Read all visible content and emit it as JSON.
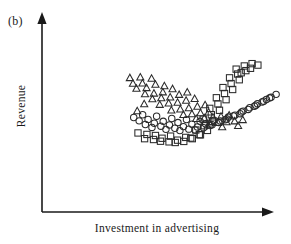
{
  "figure": {
    "panel_label": "(b)",
    "x_axis_label": "Investment in advertising",
    "y_axis_label": "Revenue"
  },
  "chart_data": {
    "type": "scatter",
    "title": "",
    "subtitle": "",
    "xlabel": "Investment in advertising",
    "ylabel": "Revenue",
    "panel": "(b)",
    "grid": false,
    "legend": "none",
    "axis_style": "arrow-tipped L-shaped axes, no tick marks, no tick labels",
    "xlim": [
      0,
      100
    ],
    "ylim": [
      0,
      100
    ],
    "marker_styles": {
      "triangle": "open upward triangle",
      "circle": "open circle",
      "square": "open square"
    },
    "series": [
      {
        "name": "triangle-group",
        "marker": "triangle",
        "count": 46,
        "trend": "decreasing",
        "points": [
          [
            22.6,
            79.8
          ],
          [
            28.0,
            80.4
          ],
          [
            24.2,
            74.5
          ],
          [
            29.1,
            74.8
          ],
          [
            33.8,
            79.2
          ],
          [
            26.0,
            69.8
          ],
          [
            31.2,
            70.4
          ],
          [
            35.8,
            73.6
          ],
          [
            40.4,
            72.2
          ],
          [
            30.4,
            64.6
          ],
          [
            35.0,
            65.2
          ],
          [
            39.6,
            66.4
          ],
          [
            44.6,
            69.4
          ],
          [
            34.2,
            59.8
          ],
          [
            38.8,
            60.8
          ],
          [
            43.4,
            61.6
          ],
          [
            48.0,
            64.0
          ],
          [
            52.2,
            66.2
          ],
          [
            30.0,
            55.2
          ],
          [
            38.0,
            54.6
          ],
          [
            42.6,
            55.8
          ],
          [
            47.2,
            56.6
          ],
          [
            51.6,
            58.4
          ],
          [
            56.0,
            60.1
          ],
          [
            26.4,
            48.6
          ],
          [
            44.0,
            49.2
          ],
          [
            48.6,
            50.2
          ],
          [
            53.0,
            51.4
          ],
          [
            57.4,
            52.8
          ],
          [
            61.4,
            54.2
          ],
          [
            50.2,
            45.0
          ],
          [
            54.6,
            45.8
          ],
          [
            59.0,
            46.6
          ],
          [
            63.2,
            47.4
          ],
          [
            56.8,
            41.2
          ],
          [
            61.0,
            41.8
          ],
          [
            65.4,
            42.6
          ],
          [
            69.6,
            43.4
          ],
          [
            73.8,
            44.6
          ],
          [
            63.6,
            37.0
          ],
          [
            68.0,
            37.6
          ],
          [
            72.4,
            38.2
          ],
          [
            76.6,
            39.0
          ],
          [
            80.8,
            40.2
          ],
          [
            70.2,
            33.4
          ],
          [
            78.4,
            34.6
          ]
        ]
      },
      {
        "name": "circle-group",
        "marker": "circle",
        "count": 49,
        "trend": "increasing",
        "points": [
          [
            24.6,
            42.0
          ],
          [
            29.2,
            44.6
          ],
          [
            27.4,
            38.8
          ],
          [
            32.0,
            40.2
          ],
          [
            36.4,
            43.2
          ],
          [
            30.6,
            35.4
          ],
          [
            35.2,
            36.6
          ],
          [
            39.8,
            38.4
          ],
          [
            44.2,
            41.0
          ],
          [
            34.0,
            32.6
          ],
          [
            38.6,
            33.8
          ],
          [
            43.0,
            35.0
          ],
          [
            47.4,
            37.2
          ],
          [
            51.8,
            40.0
          ],
          [
            41.2,
            30.8
          ],
          [
            45.8,
            31.8
          ],
          [
            50.2,
            33.4
          ],
          [
            54.6,
            35.6
          ],
          [
            58.8,
            38.4
          ],
          [
            48.4,
            29.6
          ],
          [
            53.0,
            31.0
          ],
          [
            57.4,
            33.0
          ],
          [
            61.6,
            36.0
          ],
          [
            66.0,
            39.4
          ],
          [
            56.2,
            30.2
          ],
          [
            60.6,
            32.4
          ],
          [
            65.0,
            35.2
          ],
          [
            69.2,
            38.6
          ],
          [
            73.4,
            42.4
          ],
          [
            64.0,
            34.4
          ],
          [
            68.4,
            37.2
          ],
          [
            72.6,
            40.6
          ],
          [
            76.8,
            44.2
          ],
          [
            81.0,
            48.0
          ],
          [
            71.8,
            39.8
          ],
          [
            76.0,
            43.4
          ],
          [
            80.2,
            47.2
          ],
          [
            84.4,
            51.2
          ],
          [
            88.4,
            55.0
          ],
          [
            79.4,
            45.6
          ],
          [
            83.6,
            49.6
          ],
          [
            87.6,
            53.6
          ],
          [
            91.6,
            57.4
          ],
          [
            95.4,
            61.0
          ],
          [
            86.8,
            52.6
          ],
          [
            90.8,
            56.6
          ],
          [
            94.6,
            60.4
          ],
          [
            98.0,
            63.8
          ],
          [
            93.0,
            59.0
          ]
        ]
      },
      {
        "name": "square-group",
        "marker": "square",
        "count": 42,
        "trend": "increasing",
        "points": [
          [
            26.8,
            27.4
          ],
          [
            31.4,
            26.0
          ],
          [
            35.8,
            25.0
          ],
          [
            30.2,
            22.0
          ],
          [
            34.8,
            21.2
          ],
          [
            39.2,
            22.4
          ],
          [
            43.6,
            24.4
          ],
          [
            38.4,
            19.6
          ],
          [
            42.8,
            19.0
          ],
          [
            47.2,
            20.6
          ],
          [
            51.4,
            23.2
          ],
          [
            46.0,
            18.4
          ],
          [
            50.4,
            19.4
          ],
          [
            54.8,
            22.0
          ],
          [
            59.0,
            25.6
          ],
          [
            54.0,
            22.6
          ],
          [
            58.4,
            25.8
          ],
          [
            62.6,
            29.8
          ],
          [
            56.6,
            30.2
          ],
          [
            61.0,
            34.2
          ],
          [
            65.2,
            38.4
          ],
          [
            60.4,
            40.4
          ],
          [
            64.6,
            44.6
          ],
          [
            68.8,
            48.8
          ],
          [
            63.8,
            50.6
          ],
          [
            68.0,
            54.8
          ],
          [
            72.2,
            58.8
          ],
          [
            67.2,
            60.6
          ],
          [
            71.4,
            64.6
          ],
          [
            75.6,
            68.4
          ],
          [
            70.6,
            70.2
          ],
          [
            74.8,
            74.0
          ],
          [
            79.0,
            77.6
          ],
          [
            74.0,
            79.4
          ],
          [
            78.2,
            83.0
          ],
          [
            82.4,
            86.2
          ],
          [
            77.4,
            87.6
          ],
          [
            81.6,
            90.6
          ],
          [
            85.6,
            92.8
          ],
          [
            84.8,
            88.4
          ],
          [
            88.6,
            91.4
          ],
          [
            80.0,
            84.2
          ]
        ]
      }
    ]
  }
}
